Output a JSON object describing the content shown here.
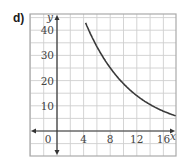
{
  "panel_label": "d)",
  "chart_data": {
    "type": "line",
    "title": "",
    "xlabel": "x",
    "ylabel": "y",
    "xlim": [
      -4,
      18
    ],
    "ylim": [
      -5,
      45
    ],
    "x_ticks": [
      "0",
      "4",
      "8",
      "12",
      "16"
    ],
    "y_ticks": [
      "10",
      "20",
      "30",
      "40"
    ],
    "grid": true,
    "grid_step_x": 2,
    "grid_step_y": 5,
    "series": [
      {
        "name": "curve",
        "function": "exponential decay, approx y = 80(0.865)^x",
        "x": [
          4.5,
          6,
          8,
          10,
          12,
          14,
          16,
          18
        ],
        "values": [
          42,
          33.5,
          25,
          18.7,
          14,
          10.5,
          7.8,
          5.9
        ]
      }
    ],
    "color": "#3a3a3a"
  }
}
